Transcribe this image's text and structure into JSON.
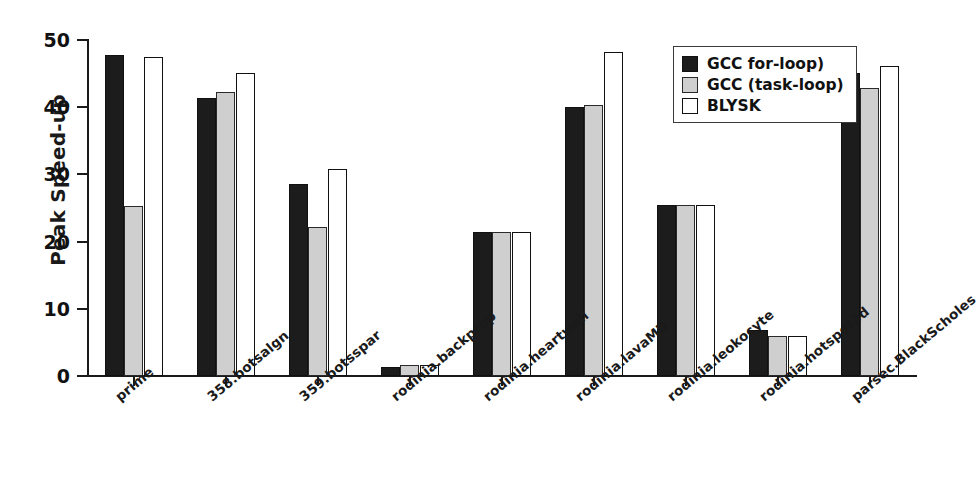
{
  "chart_data": {
    "type": "bar",
    "title": "",
    "xlabel": "",
    "ylabel": "Peak Speed-up",
    "ylim": [
      0,
      50
    ],
    "yticks": [
      0,
      10,
      20,
      30,
      40,
      50
    ],
    "grid": false,
    "legend_position": "top-right",
    "categories": [
      "prime",
      "358.botsalgn",
      "359.botsspar",
      "rodinia.backprop",
      "rodinia.heartwall",
      "rodinia.lavaMD",
      "rodinia.leokocyte",
      "rodinia.hotspot3d",
      "parsec.BlackScholes"
    ],
    "series": [
      {
        "name": "GCC for-loop)",
        "color": "#1c1c1c",
        "values": [
          47.7,
          41.4,
          28.6,
          1.3,
          21.5,
          40.0,
          25.5,
          6.9,
          45.1
        ]
      },
      {
        "name": "GCC (task-loop)",
        "color": "#cfcfcf",
        "values": [
          25.3,
          42.2,
          22.2,
          1.6,
          21.4,
          40.4,
          25.5,
          5.9,
          42.8
        ]
      },
      {
        "name": "BLYSK",
        "color": "#ffffff",
        "values": [
          47.4,
          45.1,
          30.8,
          1.6,
          21.5,
          48.2,
          25.5,
          5.9,
          46.2
        ]
      }
    ]
  },
  "legend": {
    "entries": [
      {
        "label": "GCC for-loop)"
      },
      {
        "label": "GCC (task-loop)"
      },
      {
        "label": "BLYSK"
      }
    ]
  },
  "axes": {
    "y_axis_label": "Peak Speed-up",
    "y_tick_labels": [
      "0",
      "10",
      "20",
      "30",
      "40",
      "50"
    ],
    "x_tick_labels": [
      "prime",
      "358.botsalgn",
      "359.botsspar",
      "rodinia.backprop",
      "rodinia.heartwall",
      "rodinia.lavaMD",
      "rodinia.leokocyte",
      "rodinia.hotspot3d",
      "parsec.BlackScholes"
    ]
  }
}
